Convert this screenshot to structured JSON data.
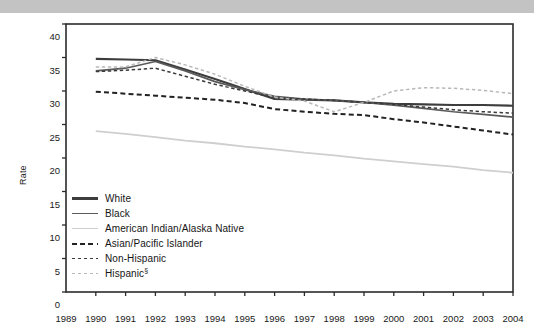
{
  "figure": {
    "y_axis_label": "Rate",
    "background_color": "#ffffff",
    "top_band_color": "#c3c3c3"
  },
  "chart_data": {
    "type": "line",
    "title": "",
    "xlabel": "",
    "ylabel": "Rate",
    "xlim": [
      1989,
      2004
    ],
    "ylim": [
      0,
      40
    ],
    "ytick_values": [
      0,
      5,
      10,
      15,
      20,
      25,
      30,
      35,
      40
    ],
    "ytick_labels": [
      "0",
      "5",
      "10",
      "15",
      "20",
      "25",
      "30",
      "35",
      "40"
    ],
    "xtick_labels": [
      "1989",
      "1990",
      "1991",
      "1992",
      "1993",
      "1994",
      "1995",
      "1996",
      "1997",
      "1998",
      "1999",
      "2000",
      "2001",
      "2002",
      "2003",
      "2004"
    ],
    "x": [
      1990,
      1991,
      1992,
      1993,
      1994,
      1995,
      1996,
      1997,
      1998,
      1999,
      2000,
      2001,
      2002,
      2003,
      2004
    ],
    "grid": false,
    "legend_position": "lower-left-inside",
    "series": [
      {
        "name": "White",
        "color": "#3d3d3d",
        "style": "solid",
        "width": 2.1,
        "values": [
          34.8,
          34.7,
          34.6,
          33.2,
          31.8,
          30.3,
          28.8,
          28.7,
          28.6,
          28.3,
          28.1,
          28.0,
          27.9,
          27.9,
          27.8
        ]
      },
      {
        "name": "Black",
        "color": "#5a5a5a",
        "style": "solid",
        "width": 1.7,
        "values": [
          33.0,
          33.4,
          34.4,
          33.0,
          31.4,
          30.2,
          29.2,
          28.8,
          28.6,
          28.3,
          27.9,
          27.4,
          26.9,
          26.5,
          26.1
        ]
      },
      {
        "name": "American Indian/Alaska Native",
        "color": "#cfcfcf",
        "style": "solid",
        "width": 1.8,
        "values": [
          24.0,
          23.6,
          23.1,
          22.6,
          22.2,
          21.7,
          21.3,
          20.8,
          20.4,
          19.9,
          19.5,
          19.1,
          18.7,
          18.2,
          17.8
        ]
      },
      {
        "name": "Asian/Pacific Islander",
        "color": "#222222",
        "style": "dashed",
        "width": 2.0,
        "values": [
          29.9,
          29.6,
          29.3,
          29.0,
          28.7,
          28.2,
          27.3,
          26.9,
          26.6,
          26.4,
          25.8,
          25.3,
          24.7,
          24.1,
          23.5
        ]
      },
      {
        "name": "Non-Hispanic",
        "color": "#3a3a3a",
        "style": "dashed-fine",
        "width": 1.5,
        "values": [
          32.9,
          33.1,
          33.4,
          32.2,
          31.0,
          30.0,
          29.0,
          28.8,
          28.6,
          28.3,
          28.0,
          27.6,
          27.2,
          26.9,
          26.7
        ]
      },
      {
        "name": "Hispanic",
        "label_suffix": "§",
        "color": "#b9b9b9",
        "style": "dashed-fine",
        "width": 1.5,
        "values": [
          33.6,
          33.6,
          35.0,
          33.9,
          32.5,
          30.7,
          29.1,
          28.5,
          26.9,
          28.3,
          30.0,
          30.5,
          30.4,
          30.1,
          29.6
        ]
      }
    ]
  },
  "legend": {
    "items": [
      {
        "label": "White"
      },
      {
        "label": "Black"
      },
      {
        "label": "American Indian/Alaska Native"
      },
      {
        "label": "Asian/Pacific Islander"
      },
      {
        "label": "Non-Hispanic"
      },
      {
        "label": "Hispanic",
        "sup": "§"
      }
    ]
  }
}
